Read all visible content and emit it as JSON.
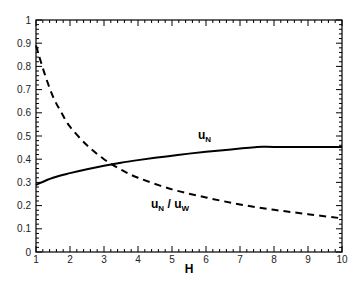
{
  "chart_data": {
    "type": "line",
    "title": "",
    "xlabel": "H",
    "ylabel": "",
    "xlim": [
      1,
      10
    ],
    "ylim": [
      0,
      1
    ],
    "grid": false,
    "legend": "none (inline curve labels)",
    "x_ticks": [
      "1",
      "2",
      "3",
      "4",
      "5",
      "6",
      "7",
      "8",
      "9",
      "10"
    ],
    "y_ticks": [
      "0",
      "0.1",
      "0.2",
      "0.3",
      "0.4",
      "0.5",
      "0.6",
      "0.7",
      "0.8",
      "0.9",
      "1"
    ],
    "series": [
      {
        "name": "u_N",
        "style": "solid",
        "label": {
          "main": "u",
          "sub": "N"
        },
        "x": [
          1,
          1.5,
          2,
          2.5,
          3,
          3.5,
          4,
          4.5,
          5,
          5.5,
          6,
          6.5,
          7,
          7.5,
          8,
          9,
          10
        ],
        "y": [
          0.29,
          0.32,
          0.34,
          0.357,
          0.372,
          0.385,
          0.396,
          0.406,
          0.415,
          0.424,
          0.432,
          0.439,
          0.446,
          0.453,
          0.453,
          0.453,
          0.453
        ]
      },
      {
        "name": "u_N / u_W",
        "style": "dashed",
        "label": {
          "main1": "u",
          "sub1": "N",
          "sep": " / ",
          "main2": "u",
          "sub2": "W"
        },
        "x": [
          1,
          1.25,
          1.5,
          1.75,
          2,
          2.5,
          3,
          3.5,
          4,
          5,
          6,
          7,
          8,
          9,
          10
        ],
        "y": [
          0.89,
          0.77,
          0.67,
          0.6,
          0.54,
          0.46,
          0.4,
          0.355,
          0.32,
          0.27,
          0.235,
          0.205,
          0.182,
          0.163,
          0.145
        ]
      }
    ]
  }
}
